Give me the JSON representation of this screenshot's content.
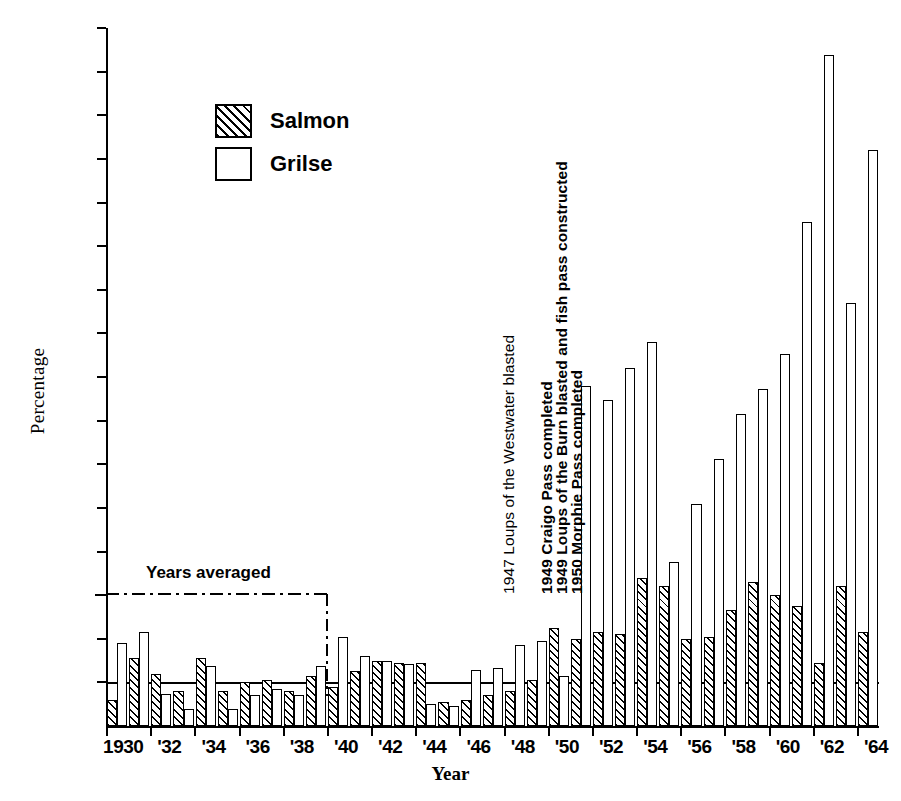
{
  "chart_data": {
    "type": "bar",
    "title": "",
    "xlabel": "Year",
    "ylabel": "Percentage",
    "ylim": [
      0,
      1600
    ],
    "ytick_step": 100,
    "yticks": [
      100,
      200,
      300,
      400,
      500,
      600,
      700,
      800,
      900,
      1000,
      1100,
      1200,
      1300,
      1400,
      1500,
      1600
    ],
    "grid": false,
    "reference_line": 100,
    "legend_position": "upper-left-inside",
    "categories": [
      "1930",
      "1931",
      "1932",
      "1933",
      "1934",
      "1935",
      "1936",
      "1937",
      "1938",
      "1939",
      "1940",
      "1941",
      "1942",
      "1943",
      "1944",
      "1945",
      "1946",
      "1947",
      "1948",
      "1949",
      "1950",
      "1951",
      "1952",
      "1953",
      "1954",
      "1955",
      "1956",
      "1957",
      "1958",
      "1959",
      "1960",
      "1961",
      "1962",
      "1963",
      "1964"
    ],
    "xtick_labels": [
      "1930",
      "'32",
      "'34",
      "'36",
      "'38",
      "'40",
      "'42",
      "'44",
      "'46",
      "'48",
      "'50",
      "'52",
      "'54",
      "'56",
      "'58",
      "'60",
      "'62",
      "'64"
    ],
    "series": [
      {
        "name": "Salmon",
        "fill": "hatched",
        "values": [
          60,
          155,
          120,
          80,
          155,
          80,
          100,
          105,
          80,
          115,
          90,
          125,
          150,
          145,
          145,
          55,
          60,
          70,
          80,
          105,
          225,
          200,
          215,
          210,
          340,
          320,
          200,
          205,
          265,
          330,
          300,
          275,
          145,
          320,
          215
        ]
      },
      {
        "name": "Grilse",
        "fill": "white",
        "values": [
          190,
          215,
          73,
          38,
          138,
          38,
          72,
          84,
          70,
          138,
          205,
          160,
          148,
          143,
          50,
          45,
          128,
          133,
          185,
          195,
          115,
          780,
          748,
          820,
          880,
          375,
          508,
          613,
          715,
          772,
          852,
          1155,
          1537,
          970,
          1320
        ]
      }
    ]
  },
  "legend": {
    "items": [
      {
        "label": "Salmon",
        "fill": "hatched"
      },
      {
        "label": "Grilse",
        "fill": "white"
      }
    ]
  },
  "annotations": {
    "years_averaged": "Years averaged",
    "events": [
      "1947 Loups of the Westwater blasted",
      "1949 Craigo Pass completed",
      "1949 Loups of the Burn blasted and fish pass constructed",
      "1950 Morphie Pass completed"
    ]
  }
}
